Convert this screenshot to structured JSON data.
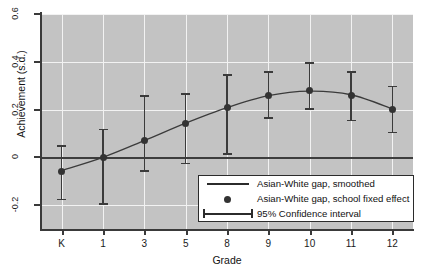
{
  "chart_data": {
    "type": "line",
    "title": "",
    "xlabel": "Grade",
    "ylabel": "Achievement (s.d.)",
    "categories": [
      "K",
      "1",
      "3",
      "5",
      "8",
      "9",
      "10",
      "11",
      "12"
    ],
    "x_tick_labels": [
      "K",
      "1",
      "3",
      "5",
      "8",
      "9",
      "10",
      "11",
      "12"
    ],
    "y_tick_labels": [
      "0.6",
      "0.4",
      "0.2",
      "0",
      "-0.2"
    ],
    "y_ticks": [
      0.6,
      0.4,
      0.2,
      0,
      -0.2
    ],
    "ylim": [
      -0.3,
      0.6
    ],
    "grid": true,
    "legend_position": "bottom-right",
    "zero_reference_line": 0,
    "series": [
      {
        "name": "Asian-White gap, school fixed effect",
        "type": "scatter-with-errorbars",
        "values": [
          -0.06,
          0.0,
          0.07,
          0.14,
          0.21,
          0.26,
          0.28,
          0.26,
          0.2
        ],
        "ci_lower": [
          -0.18,
          -0.2,
          -0.06,
          -0.03,
          0.01,
          0.16,
          0.2,
          0.15,
          0.1
        ],
        "ci_upper": [
          0.05,
          0.12,
          0.26,
          0.27,
          0.35,
          0.36,
          0.4,
          0.36,
          0.3
        ]
      },
      {
        "name": "Asian-White gap, smoothed",
        "type": "line",
        "values": [
          -0.055,
          0.0,
          0.07,
          0.143,
          0.208,
          0.258,
          0.277,
          0.262,
          0.203
        ]
      }
    ],
    "legend": [
      {
        "label": "Asian-White gap, smoothed",
        "key": "line"
      },
      {
        "label": "Asian-White gap, school fixed effect",
        "key": "dot"
      },
      {
        "label": "95% Confidence interval",
        "key": "errorbar"
      }
    ],
    "colors": {
      "plot_background": "#c3c3c3",
      "gridline": "#f2f2f2",
      "marker": "#333333",
      "line": "#3b3b3b",
      "axis": "#3a3a3a",
      "legend_background": "#ffffff",
      "legend_border": "#2b2b2b"
    }
  }
}
